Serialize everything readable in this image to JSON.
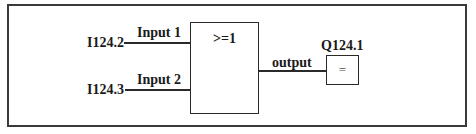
{
  "diagram": {
    "inputs": [
      {
        "address": "I124.2",
        "signal_label": "Input 1"
      },
      {
        "address": "I124.3",
        "signal_label": "Input 2"
      }
    ],
    "gate": {
      "type": "OR",
      "symbol": ">=1"
    },
    "output_line": {
      "label": "output"
    },
    "coil": {
      "address": "Q124.1",
      "symbol": "="
    }
  }
}
